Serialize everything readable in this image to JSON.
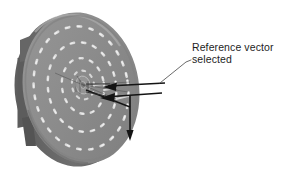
{
  "figure": {
    "name": "disc-reference-vector-diagram",
    "background_color": "#ffffff",
    "width": 282,
    "height": 179
  },
  "annotation": {
    "line1": "Reference vector",
    "line2": "selected",
    "text_color": "#1d1d1d",
    "leader_line_color": "#5a5a5a"
  },
  "disc": {
    "face_color": "#8d8d8d",
    "face_color_dark": "#7a7a7a",
    "rim_color": "#6a6a6a",
    "rim_shadow_color": "#565656",
    "edge_highlight_color": "#a5a5a5",
    "track_color": "#d9d9d9",
    "track_bead_color": "#e8e8e8",
    "hub_color": "#9a9a9a"
  },
  "vectors": {
    "arrow_color": "#1a1a1a",
    "count": 3,
    "labels": [
      "reference-vector-upper",
      "reference-vector-lower",
      "vertical-vector"
    ]
  },
  "tracks": {
    "count": 4,
    "description": "concentric beaded spiral tracks"
  }
}
